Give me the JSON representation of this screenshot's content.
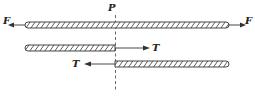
{
  "diagram": {
    "title": "",
    "labels": {
      "force_left": "F",
      "force_right": "F",
      "section": "P",
      "tension_right": "T",
      "tension_left": "T"
    },
    "elements": [
      {
        "id": "top-rod",
        "type": "hatched-rod",
        "description": "full rod under axial load F at both ends"
      },
      {
        "id": "middle-rod",
        "type": "hatched-rod",
        "description": "left portion cut at section P, internal force T pointing right"
      },
      {
        "id": "bottom-rod",
        "type": "hatched-rod",
        "description": "right portion cut at section P, internal force T pointing left"
      },
      {
        "id": "section-line",
        "type": "dashed-line",
        "description": "cutting plane P"
      }
    ],
    "colors": {
      "stroke": "#333333",
      "background": "#ffffff"
    }
  }
}
